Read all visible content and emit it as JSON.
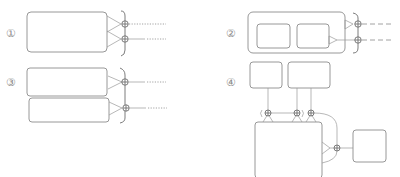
{
  "figure": {
    "type": "schematic diagram",
    "panels": [
      {
        "id": "1",
        "label": "①",
        "description": "single rounded box with two triangular outputs joined to two ports, bracketed, dotted output lines"
      },
      {
        "id": "2",
        "label": "②",
        "description": "outer rounded box containing two inner boxes, two triangular outputs to two ports, bracketed, dashed output lines"
      },
      {
        "id": "3",
        "label": "③",
        "description": "two stacked rounded boxes each with one triangular output to a port, bracketed, dotted output lines"
      },
      {
        "id": "4",
        "label": "④",
        "description": "two top boxes feeding three ports above a large box; large box output to a port connected to a small right box"
      }
    ]
  },
  "colors": {
    "stroke": "#8c8c8c",
    "stroke_dark": "#6e6e6e",
    "label": "#8a8a8a",
    "background": "#ffffff"
  }
}
